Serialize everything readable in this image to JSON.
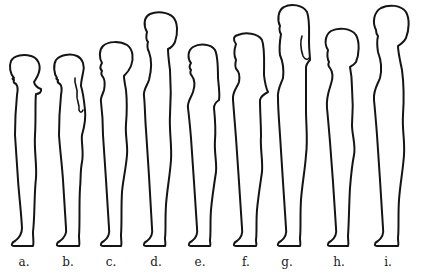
{
  "figure": {
    "line_color": "#141414",
    "background": "#ffffff",
    "figures": [
      {
        "label": "a.",
        "center_x": 22,
        "head_top_y": 56
      },
      {
        "label": "b.",
        "center_x": 68,
        "head_top_y": 55
      },
      {
        "label": "c.",
        "center_x": 111,
        "head_top_y": 43
      },
      {
        "label": "d.",
        "center_x": 156,
        "head_top_y": 13
      },
      {
        "label": "e.",
        "center_x": 200,
        "head_top_y": 44
      },
      {
        "label": "f.",
        "center_x": 246,
        "head_top_y": 33
      },
      {
        "label": "g.",
        "center_x": 287,
        "head_top_y": 5
      },
      {
        "label": "h.",
        "center_x": 339,
        "head_top_y": 29
      },
      {
        "label": "i.",
        "center_x": 388,
        "head_top_y": 5
      }
    ],
    "feet_y": 246
  }
}
